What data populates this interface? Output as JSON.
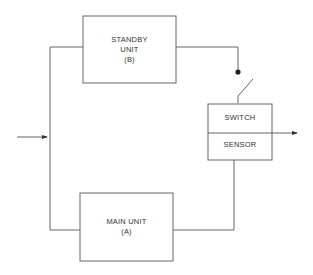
{
  "diagram": {
    "type": "standby redundancy block diagram",
    "blocks": {
      "standby": {
        "line1": "STANDBY",
        "line2": "UNIT",
        "line3": "(B)"
      },
      "main": {
        "line1": "MAIN UNIT",
        "line2": "(A)"
      },
      "switch": {
        "label": "SWITCH"
      },
      "sensor": {
        "label": "SENSOR"
      }
    },
    "connections": [
      {
        "from": "input",
        "to": "left-bus"
      },
      {
        "from": "left-bus",
        "to": "standby"
      },
      {
        "from": "left-bus",
        "to": "main"
      },
      {
        "from": "standby",
        "to": "switch",
        "via": "open-contact"
      },
      {
        "from": "main",
        "to": "sensor"
      },
      {
        "from": "switch",
        "to": "output"
      }
    ],
    "colors": {
      "line": "#555555",
      "text": "#333333",
      "background": "#ffffff"
    }
  }
}
